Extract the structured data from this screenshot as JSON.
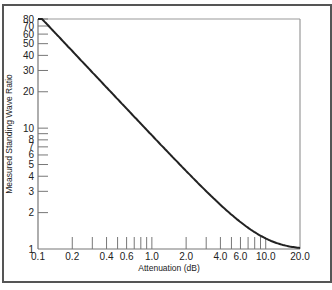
{
  "chart_data": {
    "type": "line",
    "title": "",
    "xlabel": "Attenuation (dB)",
    "ylabel": "Measured Standing Wave Ratio",
    "xscale": "log",
    "yscale": "log",
    "xlim": [
      0.1,
      20.0
    ],
    "ylim": [
      1,
      80
    ],
    "grid": false,
    "legend": null,
    "x_tick_labels": [
      "0.1",
      "0.2",
      "0.4",
      "0.6",
      "1.0",
      "2.0",
      "4.0",
      "6.0",
      "10.0",
      "20.0"
    ],
    "x_minor_ticks": [
      0.2,
      0.3,
      0.4,
      0.5,
      0.6,
      0.7,
      0.8,
      0.9,
      1.0,
      2.0,
      3.0,
      4.0,
      5.0,
      6.0,
      7.0,
      8.0,
      9.0,
      10.0
    ],
    "y_tick_labels": [
      "1",
      "2",
      "3",
      "4",
      "5",
      "6",
      "7",
      "8",
      "10",
      "20",
      "30",
      "40",
      "50",
      "60",
      "70",
      "80"
    ],
    "y_ticks": [
      2,
      3,
      4,
      5,
      6,
      7,
      8,
      9,
      10,
      20,
      30,
      40,
      50,
      60,
      70,
      80
    ],
    "series": [
      {
        "name": "SWR vs Attenuation",
        "x": [
          0.1,
          0.15,
          0.2,
          0.3,
          0.4,
          0.5,
          0.6,
          0.8,
          1.0,
          1.5,
          2.0,
          3.0,
          4.0,
          5.0,
          6.0,
          7.0,
          8.0,
          10.0,
          12.0,
          15.0,
          20.0
        ],
        "y": [
          80,
          58,
          43.4,
          29,
          21.7,
          17.4,
          14.5,
          10.9,
          8.7,
          5.85,
          4.42,
          3.01,
          2.32,
          1.93,
          1.67,
          1.5,
          1.38,
          1.22,
          1.13,
          1.07,
          1.02
        ]
      }
    ]
  }
}
